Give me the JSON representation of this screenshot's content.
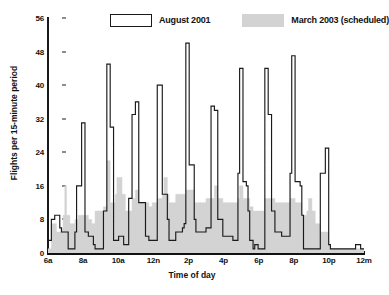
{
  "chart_data": {
    "type": "area",
    "title": "",
    "xlabel": "Time of day",
    "ylabel": "Flights per 15-minute period",
    "ylim": [
      0,
      56
    ],
    "yticks": [
      0,
      8,
      16,
      24,
      32,
      40,
      48,
      56
    ],
    "xlim": [
      6,
      24
    ],
    "xticks": [
      6,
      8,
      10,
      12,
      14,
      16,
      18,
      20,
      22,
      24
    ],
    "xticklabels": [
      "6a",
      "8a",
      "10a",
      "12n",
      "2p",
      "4p",
      "6p",
      "8p",
      "10p",
      "12m"
    ],
    "grid": false,
    "legend_position": "top",
    "bin_minutes": 15,
    "x_start_hour": 6,
    "series": [
      {
        "name": "August 2001",
        "style": "step-outline",
        "color": "#1a1a1a",
        "fill": "none",
        "values": [
          3,
          3,
          8,
          8,
          9,
          9,
          9,
          6,
          5,
          5,
          5,
          5,
          1,
          1,
          1,
          1,
          5,
          16,
          16,
          16,
          31,
          31,
          5,
          5,
          4,
          4,
          4,
          2,
          1,
          1,
          1,
          1,
          1,
          10,
          10,
          45,
          45,
          30,
          30,
          3,
          3,
          3,
          4,
          4,
          4,
          2,
          2,
          2,
          13,
          13,
          33,
          33,
          36,
          36,
          12,
          12,
          12,
          12,
          4,
          4,
          3,
          3,
          3,
          3,
          3,
          40,
          40,
          40,
          14,
          14,
          14,
          8,
          3,
          3,
          3,
          3,
          5,
          5,
          5,
          5,
          6,
          7,
          50,
          50,
          21,
          21,
          21,
          8,
          5,
          5,
          5,
          5,
          5,
          5,
          6,
          6,
          6,
          35,
          35,
          34,
          34,
          8,
          8,
          8,
          4,
          4,
          4,
          4,
          4,
          4,
          3,
          3,
          3,
          19,
          44,
          44,
          17,
          17,
          16,
          10,
          3,
          3,
          1,
          2,
          2,
          1,
          1,
          1,
          1,
          44,
          44,
          33,
          33,
          10,
          10,
          5,
          5,
          5,
          5,
          4,
          4,
          4,
          4,
          4,
          19,
          47,
          47,
          17,
          17,
          17,
          16,
          9,
          1,
          1,
          1,
          1,
          1,
          1,
          1,
          1,
          1,
          1,
          19,
          19,
          19,
          25,
          25,
          2,
          1,
          1,
          1,
          1,
          1,
          1,
          1,
          1,
          1,
          1,
          1,
          1,
          1,
          1,
          1,
          2,
          2,
          2,
          1,
          1
        ]
      },
      {
        "name": "March 2003 (scheduled)",
        "style": "step-filled",
        "color": "#d3d3d3",
        "fill": "#d3d3d3",
        "values": [
          1,
          1,
          7,
          7,
          7,
          5,
          5,
          5,
          6,
          9,
          16,
          9,
          9,
          7,
          7,
          7,
          8,
          8,
          9,
          9,
          9,
          9,
          9,
          9,
          8,
          8,
          7,
          7,
          10,
          10,
          10,
          10,
          10,
          11,
          11,
          22,
          22,
          12,
          12,
          12,
          14,
          18,
          18,
          18,
          14,
          14,
          10,
          10,
          10,
          10,
          13,
          13,
          15,
          15,
          12,
          12,
          12,
          12,
          12,
          12,
          11,
          11,
          12,
          12,
          12,
          13,
          13,
          13,
          14,
          18,
          18,
          14,
          12,
          12,
          12,
          12,
          14,
          14,
          14,
          14,
          14,
          14,
          15,
          15,
          15,
          15,
          15,
          12,
          12,
          12,
          12,
          12,
          12,
          12,
          13,
          13,
          13,
          13,
          13,
          16,
          16,
          13,
          13,
          13,
          12,
          12,
          12,
          12,
          12,
          12,
          12,
          12,
          12,
          13,
          16,
          16,
          13,
          13,
          13,
          13,
          11,
          11,
          10,
          10,
          10,
          10,
          10,
          10,
          10,
          13,
          13,
          13,
          13,
          13,
          13,
          12,
          12,
          12,
          12,
          12,
          12,
          12,
          12,
          12,
          13,
          13,
          13,
          12,
          12,
          12,
          12,
          9,
          9,
          9,
          10,
          13,
          13,
          10,
          10,
          7,
          7,
          7,
          5,
          5,
          5,
          5,
          5,
          2,
          1,
          1,
          1,
          1,
          1,
          1,
          1,
          1,
          1,
          1,
          1,
          1,
          1,
          1,
          1,
          1,
          1,
          1,
          1,
          1
        ]
      }
    ]
  },
  "legend": {
    "entries": [
      {
        "label": "August 2001",
        "swatch": "outline-box"
      },
      {
        "label": "March 2003 (scheduled)",
        "swatch": "gray-box"
      }
    ]
  },
  "axes": {
    "y_title": "Flights per 15-minute period",
    "x_title": "Time of day",
    "y_tick_labels": [
      "56",
      "48",
      "40",
      "32",
      "24",
      "16",
      "8",
      "0"
    ],
    "x_tick_labels": [
      "6a",
      "8a",
      "10a",
      "12n",
      "2p",
      "4p",
      "6p",
      "8p",
      "10p",
      "12m"
    ]
  },
  "colors": {
    "august_line": "#1a1a1a",
    "march_fill": "#d3d3d3",
    "axis": "#111111",
    "background": "#ffffff"
  }
}
